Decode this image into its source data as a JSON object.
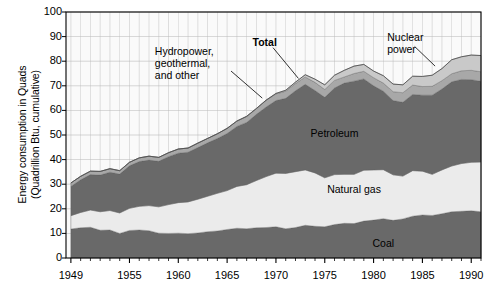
{
  "chart_data": {
    "type": "area",
    "title": "",
    "xlabel": "",
    "ylabel": "Energy consumption in Quads\n(Quadrillion Btu, cumulative)",
    "xlim": [
      1948.5,
      1991.0
    ],
    "ylim": [
      0,
      100
    ],
    "ytick_step": 10,
    "yticks": [
      0,
      10,
      20,
      30,
      40,
      50,
      60,
      70,
      80,
      90,
      100
    ],
    "xticks": [
      1949,
      1955,
      1960,
      1965,
      1970,
      1975,
      1980,
      1985,
      1990
    ],
    "xtick_labels": [
      "1949",
      "1955",
      "1960",
      "1965",
      "1970",
      "1975",
      "1980",
      "1985",
      "1990"
    ],
    "grid": true,
    "grid_minor_x": true,
    "legend_position": "inline-annotations",
    "stacked": true,
    "x": [
      1949,
      1950,
      1951,
      1952,
      1953,
      1954,
      1955,
      1956,
      1957,
      1958,
      1959,
      1960,
      1961,
      1962,
      1963,
      1964,
      1965,
      1966,
      1967,
      1968,
      1969,
      1970,
      1971,
      1972,
      1973,
      1974,
      1975,
      1976,
      1977,
      1978,
      1979,
      1980,
      1981,
      1982,
      1983,
      1984,
      1985,
      1986,
      1987,
      1988,
      1989,
      1990,
      1991
    ],
    "series": [
      {
        "name": "Coal",
        "color": "#696969",
        "label_position": {
          "x": 1981.0,
          "y": 5.5
        },
        "values": [
          11.8,
          12.3,
          12.5,
          11.3,
          11.4,
          10.0,
          11.2,
          11.4,
          11.1,
          10.1,
          10.0,
          10.1,
          9.9,
          10.2,
          10.7,
          11.0,
          11.6,
          12.1,
          11.9,
          12.3,
          12.4,
          12.7,
          11.9,
          12.4,
          13.3,
          12.9,
          12.7,
          13.6,
          14.1,
          14.0,
          15.0,
          15.4,
          16.0,
          15.3,
          15.9,
          17.0,
          17.5,
          17.3,
          18.0,
          18.8,
          19.0,
          19.2,
          18.8
        ]
      },
      {
        "name": "Natural gas",
        "color": "#ebebeb",
        "label_position": {
          "x": 1978.0,
          "y": 27.5
        },
        "values": [
          5.4,
          6.2,
          7.0,
          7.5,
          7.9,
          8.3,
          9.0,
          9.6,
          10.2,
          10.7,
          11.7,
          12.4,
          12.9,
          13.7,
          14.4,
          15.3,
          15.8,
          17.0,
          17.9,
          19.2,
          20.7,
          21.8,
          22.5,
          22.7,
          22.5,
          21.7,
          19.9,
          20.3,
          19.9,
          20.0,
          20.7,
          20.4,
          19.9,
          18.5,
          17.4,
          18.5,
          17.8,
          16.7,
          17.8,
          18.6,
          19.4,
          19.7,
          20.2
        ]
      },
      {
        "name": "Petroleum",
        "color": "#696969",
        "label_position": {
          "x": 1976.0,
          "y": 50.5
        },
        "values": [
          11.9,
          13.3,
          14.4,
          14.9,
          15.6,
          15.8,
          17.3,
          18.2,
          18.5,
          18.5,
          19.5,
          20.1,
          20.2,
          21.0,
          21.7,
          22.3,
          23.2,
          24.4,
          25.3,
          26.9,
          28.3,
          29.5,
          30.5,
          32.9,
          34.8,
          33.5,
          32.7,
          35.2,
          37.1,
          37.9,
          37.1,
          34.2,
          31.9,
          30.2,
          30.0,
          31.0,
          30.9,
          32.2,
          32.9,
          34.2,
          34.2,
          33.6,
          32.8
        ]
      },
      {
        "name": "Hydropower, geothermal, and other",
        "color": "#a8a8a8",
        "label_position": {
          "x": 1963.5,
          "y": 84.0
        },
        "annotation_text": "Hydropower,\ngeothermal,\nand other",
        "values": [
          1.4,
          1.4,
          1.4,
          1.5,
          1.4,
          1.4,
          1.4,
          1.5,
          1.6,
          1.6,
          1.6,
          1.7,
          1.7,
          1.8,
          1.8,
          1.9,
          2.1,
          2.1,
          2.4,
          2.3,
          2.7,
          2.7,
          2.9,
          2.9,
          3.0,
          3.3,
          3.2,
          3.1,
          2.5,
          3.1,
          3.1,
          3.3,
          3.3,
          3.6,
          3.9,
          3.8,
          3.5,
          3.6,
          3.4,
          3.3,
          3.5,
          3.8,
          3.9
        ]
      },
      {
        "name": "Nuclear power",
        "color": "#c9c9c9",
        "label_position": {
          "x": 1983.0,
          "y": 90.0
        },
        "annotation_text": "Nuclear\npower",
        "values": [
          0.0,
          0.0,
          0.0,
          0.0,
          0.0,
          0.0,
          0.0,
          0.0,
          0.0,
          0.0,
          0.0,
          0.0,
          0.0,
          0.0,
          0.0,
          0.0,
          0.0,
          0.1,
          0.1,
          0.1,
          0.1,
          0.2,
          0.4,
          0.6,
          0.9,
          1.3,
          1.9,
          2.1,
          2.7,
          3.0,
          2.8,
          2.7,
          3.0,
          3.1,
          3.2,
          3.6,
          4.1,
          4.5,
          4.9,
          5.7,
          5.7,
          6.2,
          6.6
        ]
      }
    ],
    "annotations": [
      {
        "name": "total",
        "text": "Total",
        "bold": true,
        "x": 1969.0,
        "y": 88.0,
        "leader_to": {
          "x": 1971.5,
          "y": 72.5
        }
      }
    ],
    "total_line": {
      "name": "Total",
      "color": "#000000"
    }
  },
  "labels": {
    "coal": "Coal",
    "natural_gas": "Natural gas",
    "petroleum": "Petroleum",
    "hydro": "Hydropower,\ngeothermal,\nand other",
    "nuclear": "Nuclear\npower",
    "total": "Total"
  },
  "axis": {
    "y_title": "Energy consumption in Quads\n(Quadrillion Btu, cumulative)",
    "y_labels": [
      "100",
      "90",
      "80",
      "70",
      "60",
      "50",
      "40",
      "30",
      "20",
      "10",
      "0"
    ],
    "x_labels": [
      "1949",
      "1955",
      "1960",
      "1965",
      "1970",
      "1975",
      "1980",
      "1985",
      "1990"
    ]
  },
  "colors": {
    "coal": "#696969",
    "natural_gas": "#ebebeb",
    "petroleum": "#696969",
    "hydro": "#a8a8a8",
    "nuclear": "#c9c9c9",
    "background": "#fafafa",
    "grid": "#b8b8b8",
    "axis": "#000000"
  }
}
